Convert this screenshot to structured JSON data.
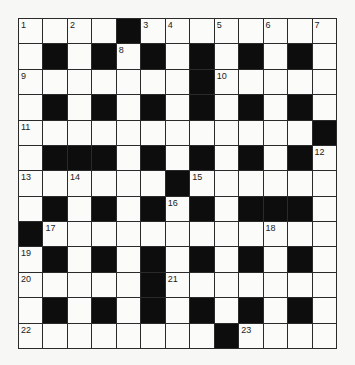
{
  "puzzle": {
    "rows": 13,
    "cols": 13,
    "grid": [
      "....#........",
      ".#.#.#.#.#.#.",
      ".......#.....",
      ".#.#.#.#.#.#.",
      "............#",
      ".###.#.#.#.#.",
      "......#......",
      ".#.#.#.#.###.",
      "#............",
      ".#.#.#.#.#.#.",
      ".....#.......",
      ".#.#.#.#.#.#.",
      "........#...."
    ],
    "numbers": [
      {
        "r": 0,
        "c": 0,
        "n": "1"
      },
      {
        "r": 0,
        "c": 2,
        "n": "2"
      },
      {
        "r": 0,
        "c": 5,
        "n": "3"
      },
      {
        "r": 0,
        "c": 6,
        "n": "4"
      },
      {
        "r": 0,
        "c": 8,
        "n": "5"
      },
      {
        "r": 0,
        "c": 10,
        "n": "6"
      },
      {
        "r": 0,
        "c": 12,
        "n": "7"
      },
      {
        "r": 1,
        "c": 4,
        "n": "8"
      },
      {
        "r": 2,
        "c": 0,
        "n": "9"
      },
      {
        "r": 2,
        "c": 8,
        "n": "10"
      },
      {
        "r": 4,
        "c": 0,
        "n": "11"
      },
      {
        "r": 5,
        "c": 12,
        "n": "12"
      },
      {
        "r": 6,
        "c": 0,
        "n": "13"
      },
      {
        "r": 6,
        "c": 2,
        "n": "14"
      },
      {
        "r": 6,
        "c": 7,
        "n": "15"
      },
      {
        "r": 7,
        "c": 6,
        "n": "16"
      },
      {
        "r": 8,
        "c": 1,
        "n": "17"
      },
      {
        "r": 8,
        "c": 10,
        "n": "18"
      },
      {
        "r": 9,
        "c": 0,
        "n": "19"
      },
      {
        "r": 10,
        "c": 0,
        "n": "20"
      },
      {
        "r": 10,
        "c": 6,
        "n": "21"
      },
      {
        "r": 12,
        "c": 0,
        "n": "22"
      },
      {
        "r": 12,
        "c": 9,
        "n": "23"
      }
    ]
  }
}
